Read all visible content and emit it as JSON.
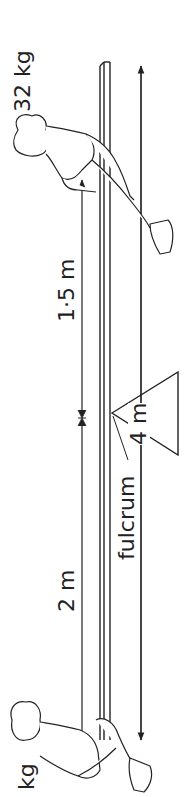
{
  "diagram": {
    "type": "lever-seesaw",
    "orientation": "rotated-90-ccw",
    "labels": {
      "right_mass": "32 kg",
      "left_mass": "kg",
      "distance_right": "1·5 m",
      "distance_left": "2 m",
      "beam_length": "4 m",
      "fulcrum": "fulcrum"
    },
    "colors": {
      "ink": "#222222",
      "background": "#ffffff"
    }
  }
}
